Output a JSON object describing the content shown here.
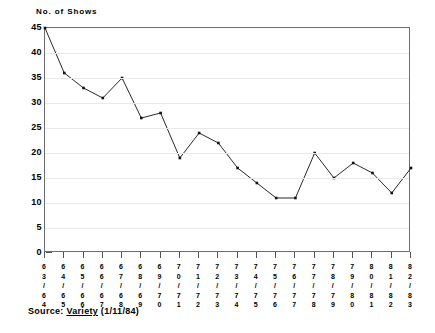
{
  "chart_data": {
    "type": "line",
    "title": "No. of Shows",
    "xlabel": "",
    "ylabel": "No. of Shows",
    "ylim": [
      0,
      45
    ],
    "yticks": [
      0,
      5,
      10,
      15,
      20,
      25,
      30,
      35,
      40,
      45
    ],
    "grid": true,
    "legend": null,
    "categories": [
      "63/64",
      "64/65",
      "65/66",
      "66/67",
      "67/68",
      "68/69",
      "69/70",
      "70/71",
      "71/72",
      "72/73",
      "73/74",
      "74/75",
      "75/76",
      "76/77",
      "77/78",
      "78/79",
      "79/80",
      "80/81",
      "81/82",
      "82/83"
    ],
    "category_digits": [
      [
        "6",
        "3",
        "/",
        "6",
        "4"
      ],
      [
        "6",
        "4",
        "/",
        "6",
        "5"
      ],
      [
        "6",
        "5",
        "/",
        "6",
        "6"
      ],
      [
        "6",
        "6",
        "/",
        "6",
        "7"
      ],
      [
        "6",
        "7",
        "/",
        "6",
        "8"
      ],
      [
        "6",
        "8",
        "/",
        "6",
        "9"
      ],
      [
        "6",
        "9",
        "/",
        "7",
        "0"
      ],
      [
        "7",
        "0",
        "/",
        "7",
        "1"
      ],
      [
        "7",
        "1",
        "/",
        "7",
        "2"
      ],
      [
        "7",
        "2",
        "/",
        "7",
        "3"
      ],
      [
        "7",
        "3",
        "/",
        "7",
        "4"
      ],
      [
        "7",
        "4",
        "/",
        "7",
        "5"
      ],
      [
        "7",
        "5",
        "/",
        "7",
        "6"
      ],
      [
        "7",
        "6",
        "/",
        "7",
        "7"
      ],
      [
        "7",
        "7",
        "/",
        "7",
        "8"
      ],
      [
        "7",
        "8",
        "/",
        "7",
        "9"
      ],
      [
        "7",
        "9",
        "/",
        "8",
        "0"
      ],
      [
        "8",
        "0",
        "/",
        "8",
        "1"
      ],
      [
        "8",
        "1",
        "/",
        "8",
        "2"
      ],
      [
        "8",
        "2",
        "/",
        "8",
        "3"
      ]
    ],
    "values": [
      45,
      36,
      33,
      31,
      35,
      27,
      28,
      19,
      24,
      22,
      17,
      14,
      11,
      11,
      20,
      15,
      18,
      16,
      12,
      17
    ],
    "series": [
      {
        "name": "No. of Shows",
        "values": [
          45,
          36,
          33,
          31,
          35,
          27,
          28,
          19,
          24,
          22,
          17,
          14,
          11,
          11,
          20,
          15,
          18,
          16,
          12,
          17
        ],
        "color": "#111111",
        "marker": "square"
      }
    ],
    "annotations": []
  },
  "source": {
    "prefix": "Source:",
    "publication": "Variety",
    "date": "(1/11/84)"
  }
}
